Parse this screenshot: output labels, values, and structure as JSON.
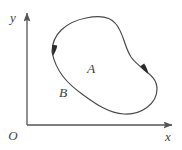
{
  "figure": {
    "background_color": "#ffffff",
    "width": 182,
    "height": 150,
    "axes": {
      "color": "#555555",
      "line_width": 1.3,
      "origin_label": "O",
      "origin_label_position": [
        12,
        138
      ],
      "x_axis": {
        "label": "x",
        "label_position": [
          168,
          139
        ],
        "y_pixel": 125,
        "start_x": 27,
        "end_x": 173,
        "arrow": "right"
      },
      "y_axis": {
        "label": "y",
        "label_position": [
          13,
          22
        ],
        "x_pixel": 27,
        "start_y": 125,
        "end_y": 12,
        "arrow": "up"
      }
    },
    "curve": {
      "name": "closed-oriented-curve",
      "shape": "bean",
      "closed": true,
      "stroke_color": "#4a4a4a",
      "stroke_width": 1.2,
      "fill": "none",
      "orientation": "clockwise",
      "path": "M 52 52 C 52 34, 66 22, 86 18 C 100 15, 110 16, 116 24 C 124 34, 124 46, 131 57 C 140 70, 157 74, 157 89 C 157 104, 141 115, 124 114 C 108 113, 96 104, 82 94 C 68 84, 56 72, 52 52 Z",
      "arrows": [
        {
          "name": "left-direction-arrow",
          "position": [
            54,
            50
          ],
          "angle_deg": 100,
          "description": "arrowhead on left side of curve pointing downward"
        },
        {
          "name": "right-direction-arrow",
          "position": [
            145,
            69
          ],
          "angle_deg": 55,
          "description": "arrowhead on right side of curve pointing down-right"
        }
      ]
    },
    "labels": [
      {
        "name": "label-A",
        "text": "A",
        "position": [
          91,
          73
        ],
        "description": "label inside the region of the curve"
      },
      {
        "name": "label-B",
        "text": "B",
        "position": [
          63,
          97
        ],
        "description": "label on the lower-left portion of the curve"
      }
    ]
  }
}
